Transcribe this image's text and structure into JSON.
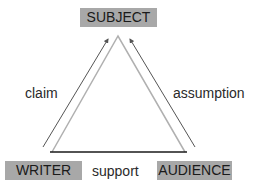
{
  "diagram": {
    "nodes": {
      "subject": "SUBJECT",
      "writer": "WRITER",
      "audience": "AUDIENCE"
    },
    "edges": {
      "left": "claim",
      "right": "assumption",
      "bottom": "support"
    },
    "colors": {
      "box_fill": "#a8a8a8",
      "inner_triangle": "#b0b0b0",
      "outer_arrows": "#555555",
      "base_line": "#1a1a1a"
    }
  }
}
